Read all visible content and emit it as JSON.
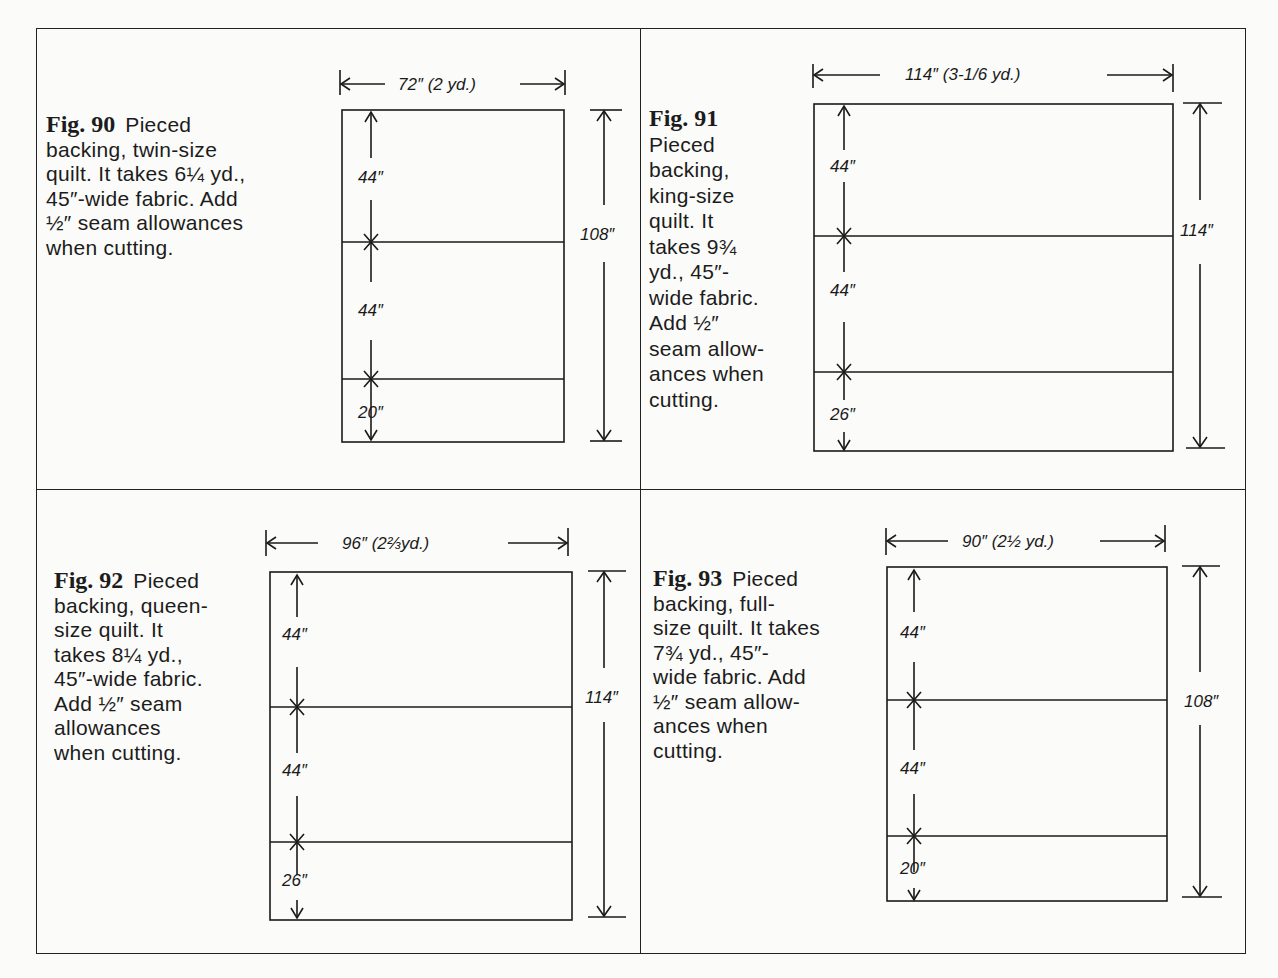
{
  "figures": [
    {
      "number": "Fig. 90",
      "caption": "Pieced backing, twin-size quilt. It takes 6¼ yd., 45″-wide fabric. Add ½″ seam allowances when cutting.",
      "caption_lines": [
        "Pieced",
        "backing, twin-size",
        "quilt. It takes 6¼ yd.,",
        "45″-wide fabric. Add",
        "½″ seam allowances",
        "when cutting."
      ],
      "width_label": "72″ (2 yd.)",
      "height_label": "108″",
      "panel_labels": [
        "44″",
        "44″",
        "20″"
      ]
    },
    {
      "number": "Fig. 91",
      "caption": "Pieced backing, king-size quilt. It takes 9¾ yd., 45″-wide fabric. Add ½″ seam allowances when cutting.",
      "caption_lines": [
        "Pieced",
        "backing,",
        "king-size",
        "quilt. It",
        "takes 9¾",
        "yd., 45″-",
        "wide fabric.",
        "Add ½″",
        "seam allow-",
        "ances when",
        "cutting."
      ],
      "width_label": "114″ (3-1/6 yd.)",
      "height_label": "114″",
      "panel_labels": [
        "44″",
        "44″",
        "26″"
      ]
    },
    {
      "number": "Fig. 92",
      "caption": "Pieced backing, queen-size quilt. It takes 8¼ yd., 45″-wide fabric. Add ½″ seam allowances when cutting.",
      "caption_lines": [
        "Pieced",
        "backing, queen-",
        "size quilt. It",
        "takes 8¼  yd.,",
        "45″-wide fabric.",
        "Add ½″ seam",
        "allowances",
        "when cutting."
      ],
      "width_label": "96″ (2⅔yd.)",
      "height_label": "114″",
      "panel_labels": [
        "44″",
        "44″",
        "26″"
      ]
    },
    {
      "number": "Fig. 93",
      "caption": "Pieced backing, full-size quilt. It takes 7¾ yd., 45″-wide fabric. Add ½″ seam allowances when cutting.",
      "caption_lines": [
        "Pieced",
        "backing, full-",
        "size quilt. It takes",
        "7¾ yd., 45″-",
        "wide fabric. Add",
        "½″ seam allow-",
        "ances when",
        "cutting."
      ],
      "width_label": "90″ (2½ yd.)",
      "height_label": "108″",
      "panel_labels": [
        "44″",
        "44″",
        "20″"
      ]
    }
  ]
}
